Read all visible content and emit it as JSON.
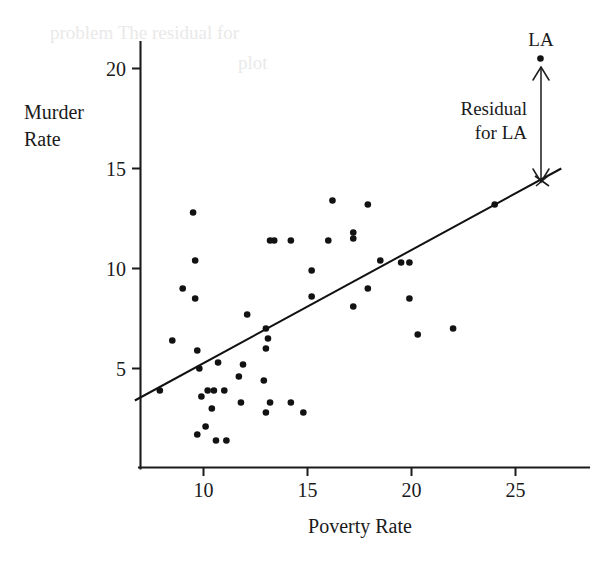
{
  "figure": {
    "kind": "scatterplot-with-regression-line",
    "background": "#ffffff",
    "ink_color": "#1a1a1a"
  },
  "axes": {
    "x_title": "Poverty Rate",
    "y_title_line1": "Murder",
    "y_title_line2": "Rate",
    "x_ticks": [
      "10",
      "15",
      "20",
      "25"
    ],
    "x_tick_values": [
      10,
      15,
      20,
      25
    ],
    "y_ticks": [
      "5",
      "10",
      "15",
      "20"
    ],
    "y_tick_values": [
      5,
      10,
      15,
      20
    ],
    "xlim": [
      7.0,
      27.2
    ],
    "ylim": [
      0.6,
      21.6
    ],
    "grid": false
  },
  "annotations": {
    "point_label": "LA",
    "residual_label_line1": "Residual",
    "residual_label_line2": "for LA",
    "residual_arrow": {
      "x": 26.2,
      "y_top": 20.5,
      "y_bottom": 14.75,
      "double_headed": true
    },
    "highlighted_point": {
      "label": "LA",
      "x": 26.2,
      "y": 20.5
    }
  },
  "chart_data": {
    "type": "scatter",
    "title": "",
    "xlabel": "Poverty Rate",
    "ylabel": "Murder Rate",
    "xlim": [
      7.0,
      27.2
    ],
    "ylim": [
      0.6,
      21.6
    ],
    "grid": false,
    "legend": null,
    "regression_line": {
      "label": "least-squares regression line",
      "x_start": 6.7,
      "y_start": 3.4,
      "x_end": 27.2,
      "y_end": 15.0,
      "slope": 0.566,
      "intercept": -0.39
    },
    "points": [
      {
        "x": 7.9,
        "y": 3.9
      },
      {
        "x": 8.5,
        "y": 6.4
      },
      {
        "x": 9.0,
        "y": 9.0
      },
      {
        "x": 9.5,
        "y": 12.8
      },
      {
        "x": 9.6,
        "y": 10.4
      },
      {
        "x": 9.6,
        "y": 8.5
      },
      {
        "x": 9.7,
        "y": 5.9
      },
      {
        "x": 9.8,
        "y": 5.0
      },
      {
        "x": 9.9,
        "y": 3.6
      },
      {
        "x": 9.7,
        "y": 1.7
      },
      {
        "x": 10.1,
        "y": 2.1
      },
      {
        "x": 10.2,
        "y": 3.9
      },
      {
        "x": 10.5,
        "y": 3.9
      },
      {
        "x": 10.4,
        "y": 3.0
      },
      {
        "x": 10.6,
        "y": 1.4
      },
      {
        "x": 10.7,
        "y": 5.3
      },
      {
        "x": 11.0,
        "y": 3.9
      },
      {
        "x": 11.1,
        "y": 1.4
      },
      {
        "x": 11.7,
        "y": 4.6
      },
      {
        "x": 11.9,
        "y": 5.2
      },
      {
        "x": 11.8,
        "y": 3.3
      },
      {
        "x": 12.1,
        "y": 7.7
      },
      {
        "x": 12.9,
        "y": 4.4
      },
      {
        "x": 13.0,
        "y": 7.0
      },
      {
        "x": 13.1,
        "y": 6.5
      },
      {
        "x": 13.0,
        "y": 6.0
      },
      {
        "x": 13.2,
        "y": 11.4
      },
      {
        "x": 13.4,
        "y": 11.4
      },
      {
        "x": 13.2,
        "y": 3.3
      },
      {
        "x": 13.0,
        "y": 2.8
      },
      {
        "x": 14.2,
        "y": 11.4
      },
      {
        "x": 14.2,
        "y": 3.3
      },
      {
        "x": 14.8,
        "y": 2.8
      },
      {
        "x": 15.2,
        "y": 9.9
      },
      {
        "x": 15.2,
        "y": 8.6
      },
      {
        "x": 16.0,
        "y": 11.4
      },
      {
        "x": 16.2,
        "y": 13.4
      },
      {
        "x": 17.2,
        "y": 11.8
      },
      {
        "x": 17.2,
        "y": 11.5
      },
      {
        "x": 17.2,
        "y": 8.1
      },
      {
        "x": 17.9,
        "y": 13.2
      },
      {
        "x": 17.9,
        "y": 9.0
      },
      {
        "x": 18.5,
        "y": 10.4
      },
      {
        "x": 19.5,
        "y": 10.3
      },
      {
        "x": 19.9,
        "y": 10.3
      },
      {
        "x": 19.9,
        "y": 8.5
      },
      {
        "x": 20.3,
        "y": 6.7
      },
      {
        "x": 22.0,
        "y": 7.0
      },
      {
        "x": 24.0,
        "y": 13.2
      },
      {
        "x": 26.2,
        "y": 20.5
      }
    ],
    "point_count": 50,
    "annotations": [
      {
        "text": "LA",
        "x": 26.2,
        "y": 21.4
      },
      {
        "text": "Residual for LA",
        "x": 23.5,
        "y": 17.6
      }
    ]
  },
  "ghost_text": {
    "line1": "  problem  The residual for",
    "line2": "  plot"
  }
}
